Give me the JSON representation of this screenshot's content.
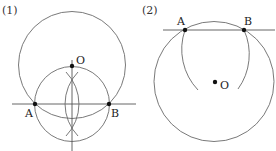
{
  "figures": [
    {
      "label": "(1)",
      "points": {
        "A": {
          "label": "A",
          "x": 35,
          "y": 104
        },
        "B": {
          "label": "B",
          "x": 109,
          "y": 104
        },
        "O": {
          "label": "O",
          "x": 72,
          "y": 66
        }
      },
      "description": "Line AB with perpendicular bisector constructed by arcs from A and B; O lies on the bisector; circle centered O through A and B; circle with diameter AB passes through O."
    },
    {
      "label": "(2)",
      "points": {
        "A": {
          "label": "A",
          "x": 185,
          "y": 30
        },
        "B": {
          "label": "B",
          "x": 244,
          "y": 30
        },
        "O": {
          "label": "O",
          "x": 215,
          "y": 81
        }
      },
      "description": "Line AB; arcs centered at A and B with radius AB meet at O (equilateral triangle); circle centered O through A and B."
    }
  ],
  "colors": {
    "stroke": "#6a6a6a",
    "dot": "#111111",
    "text": "#222222",
    "background": "#ffffff"
  }
}
